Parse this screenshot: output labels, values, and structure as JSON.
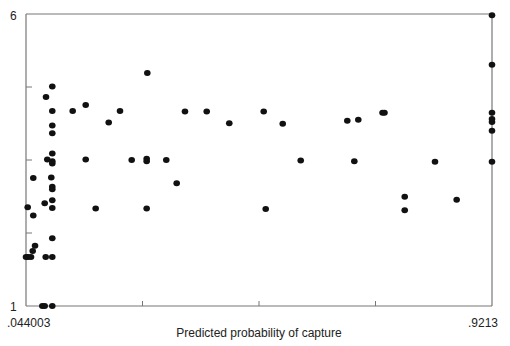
{
  "chart_data": {
    "type": "scatter",
    "title": "",
    "xlabel": "Predicted probability of capture",
    "ylabel": "",
    "xlim": [
      0.044003,
      0.9213
    ],
    "ylim": [
      1,
      6
    ],
    "x_tick_labels": [
      ".044003",
      ".9213"
    ],
    "y_tick_labels": [
      "1",
      "6"
    ],
    "x_minor_ticks": 3,
    "y_minor_ticks": 3,
    "grid": false,
    "legend": "none",
    "marker_color": "#111111",
    "axis_color": "#777777",
    "points": [
      {
        "x": 0.0935,
        "y": 4.76
      },
      {
        "x": 0.0817,
        "y": 4.58
      },
      {
        "x": 0.0935,
        "y": 4.34
      },
      {
        "x": 0.0935,
        "y": 4.09
      },
      {
        "x": 0.0935,
        "y": 3.96
      },
      {
        "x": 0.0935,
        "y": 3.61
      },
      {
        "x": 0.0841,
        "y": 3.51
      },
      {
        "x": 0.0935,
        "y": 3.48
      },
      {
        "x": 0.0935,
        "y": 3.44
      },
      {
        "x": 0.0577,
        "y": 3.19
      },
      {
        "x": 0.0916,
        "y": 3.2
      },
      {
        "x": 0.0935,
        "y": 3.04
      },
      {
        "x": 0.0935,
        "y": 3.0
      },
      {
        "x": 0.0472,
        "y": 2.69
      },
      {
        "x": 0.0577,
        "y": 2.55
      },
      {
        "x": 0.0792,
        "y": 2.76
      },
      {
        "x": 0.0935,
        "y": 2.81
      },
      {
        "x": 0.0935,
        "y": 2.68
      },
      {
        "x": 0.0935,
        "y": 2.16
      },
      {
        "x": 0.061,
        "y": 2.03
      },
      {
        "x": 0.0566,
        "y": 1.94
      },
      {
        "x": 0.044,
        "y": 1.84
      },
      {
        "x": 0.0478,
        "y": 1.84
      },
      {
        "x": 0.0534,
        "y": 1.84
      },
      {
        "x": 0.0811,
        "y": 1.84
      },
      {
        "x": 0.0935,
        "y": 1.84
      },
      {
        "x": 0.0747,
        "y": 1.0
      },
      {
        "x": 0.0792,
        "y": 1.0
      },
      {
        "x": 0.0935,
        "y": 1.0
      },
      {
        "x": 0.2724,
        "y": 4.99
      },
      {
        "x": 0.1564,
        "y": 4.44
      },
      {
        "x": 0.1319,
        "y": 4.34
      },
      {
        "x": 0.221,
        "y": 4.34
      },
      {
        "x": 0.3433,
        "y": 4.33
      },
      {
        "x": 0.3842,
        "y": 4.33
      },
      {
        "x": 0.1997,
        "y": 4.14
      },
      {
        "x": 0.1564,
        "y": 3.51
      },
      {
        "x": 0.243,
        "y": 3.5
      },
      {
        "x": 0.2712,
        "y": 3.52
      },
      {
        "x": 0.2712,
        "y": 3.48
      },
      {
        "x": 0.3081,
        "y": 3.5
      },
      {
        "x": 0.3277,
        "y": 3.1
      },
      {
        "x": 0.1752,
        "y": 2.67
      },
      {
        "x": 0.2712,
        "y": 2.67
      },
      {
        "x": 0.4267,
        "y": 4.13
      },
      {
        "x": 0.4915,
        "y": 4.33
      },
      {
        "x": 0.5273,
        "y": 4.12
      },
      {
        "x": 0.6489,
        "y": 4.17
      },
      {
        "x": 0.6696,
        "y": 4.19
      },
      {
        "x": 0.5612,
        "y": 3.49
      },
      {
        "x": 0.6621,
        "y": 3.48
      },
      {
        "x": 0.4953,
        "y": 2.66
      },
      {
        "x": 0.7152,
        "y": 4.31
      },
      {
        "x": 0.7189,
        "y": 4.31
      },
      {
        "x": 0.814,
        "y": 3.47
      },
      {
        "x": 0.757,
        "y": 2.87
      },
      {
        "x": 0.757,
        "y": 2.64
      },
      {
        "x": 0.8548,
        "y": 2.82
      },
      {
        "x": 0.9213,
        "y": 5.98
      },
      {
        "x": 0.9213,
        "y": 5.13
      },
      {
        "x": 0.9213,
        "y": 4.31
      },
      {
        "x": 0.9213,
        "y": 4.2
      },
      {
        "x": 0.9213,
        "y": 4.15
      },
      {
        "x": 0.9213,
        "y": 4.0
      },
      {
        "x": 0.9213,
        "y": 3.47
      }
    ]
  }
}
